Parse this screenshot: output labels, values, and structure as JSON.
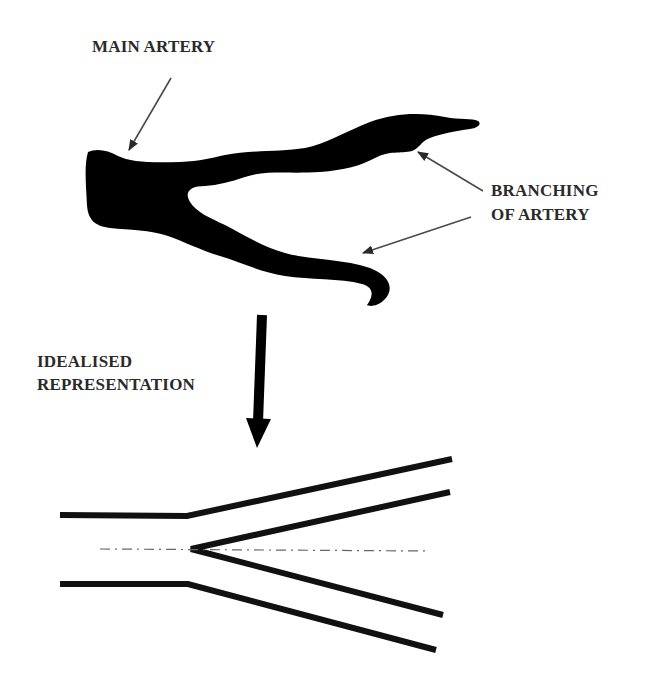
{
  "diagram": {
    "labels": {
      "main_artery": "MAIN ARTERY",
      "branching_line1": "BRANCHING",
      "branching_line2": "OF ARTERY",
      "idealised_line1": "IDEALISED",
      "idealised_line2": "REPRESENTATION"
    },
    "nodes": [
      {
        "id": "real-artery",
        "description": "Silhouette of a real artery bifurcating into two branches"
      },
      {
        "id": "idealised-model",
        "description": "Straight-walled Y-shaped bifurcation with dash-dot centerline"
      }
    ],
    "edges": [
      {
        "from": "real-artery",
        "to": "idealised-model",
        "label": "IDEALISED REPRESENTATION"
      }
    ],
    "annotations": [
      {
        "text": "MAIN ARTERY",
        "points_to": "parent vessel"
      },
      {
        "text": "BRANCHING OF ARTERY",
        "points_to": [
          "upper branch",
          "lower branch"
        ]
      }
    ],
    "colors": {
      "vessel": "#000000",
      "text": "#2a2a2a",
      "pointer": "#4a4a4a",
      "centerline": "#666666"
    }
  }
}
